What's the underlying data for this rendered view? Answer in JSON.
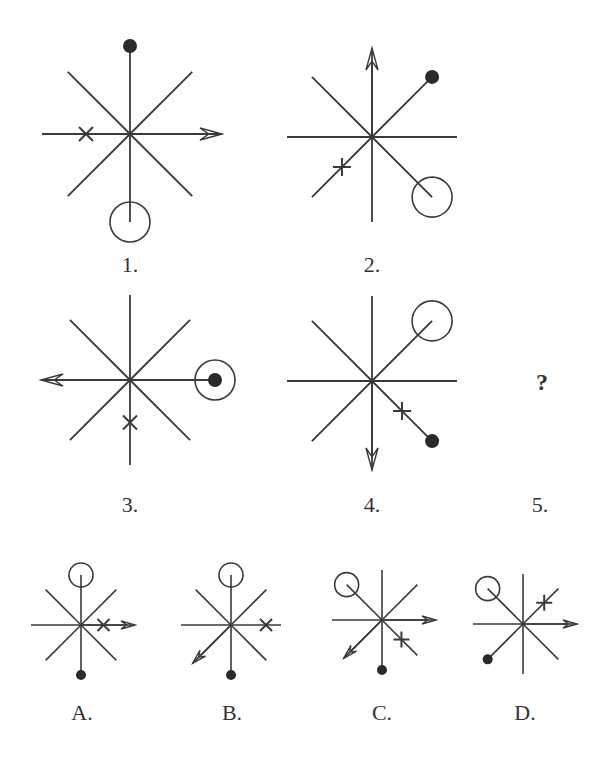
{
  "puzzle": {
    "type": "figure-reasoning",
    "question_mark": "?",
    "sequence_labels": [
      "1.",
      "2.",
      "3.",
      "4.",
      "5."
    ],
    "option_labels": [
      "A.",
      "B.",
      "C.",
      "D."
    ],
    "colors": {
      "stroke": "#3a3a3a",
      "background": "#ffffff"
    }
  },
  "figures": [
    {
      "id": "1",
      "cx": 130,
      "cy": 134,
      "r": 88,
      "arrow": "E",
      "dot": "N",
      "circle": "S",
      "mark": {
        "type": "x",
        "dir": "W",
        "pos": 0.5
      }
    },
    {
      "id": "2",
      "cx": 372,
      "cy": 137,
      "r": 85,
      "arrow": "N",
      "dot": "NE",
      "circle": "SE",
      "mark": {
        "type": "plus",
        "dir": "SW",
        "pos": 0.5
      }
    },
    {
      "id": "3",
      "cx": 130,
      "cy": 380,
      "r": 85,
      "arrow": "W",
      "dot": "E",
      "circle": "E",
      "mark": {
        "type": "x",
        "dir": "S",
        "pos": 0.5
      }
    },
    {
      "id": "4",
      "cx": 372,
      "cy": 381,
      "r": 85,
      "arrow": "S",
      "dot": "SE",
      "circle": "NE",
      "mark": {
        "type": "plus",
        "dir": "SE",
        "pos": 0.5
      }
    }
  ],
  "options": [
    {
      "id": "A",
      "cx": 81,
      "cy": 625,
      "r": 50,
      "arrow": [
        "E"
      ],
      "dot": "S",
      "circle": "N",
      "mark": {
        "type": "x",
        "dir": "E",
        "pos": 0.45
      }
    },
    {
      "id": "B",
      "cx": 231,
      "cy": 625,
      "r": 50,
      "arrow": [
        "SW"
      ],
      "dot": "S",
      "circle": "N",
      "mark": {
        "type": "x",
        "dir": "E",
        "pos": 0.7
      }
    },
    {
      "id": "C",
      "cx": 382,
      "cy": 620,
      "r": 50,
      "arrow": [
        "E",
        "SW"
      ],
      "dot": "S",
      "circle": "NW",
      "mark": {
        "type": "plus",
        "dir": "SE",
        "pos": 0.55
      }
    },
    {
      "id": "D",
      "cx": 523,
      "cy": 624,
      "r": 50,
      "arrow": [
        "E"
      ],
      "dot": "SW",
      "circle": "NW",
      "mark": {
        "type": "plus",
        "dir": "NE",
        "pos": 0.6
      }
    }
  ]
}
